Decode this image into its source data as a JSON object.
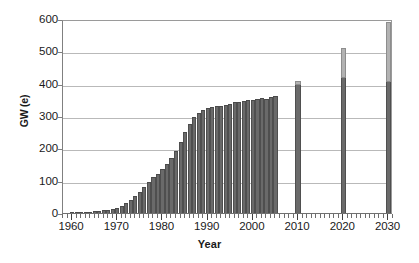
{
  "chart_data": {
    "type": "bar",
    "title": "",
    "xlabel": "Year",
    "ylabel": "GW (e)",
    "xlim": [
      1958,
      2031
    ],
    "ylim": [
      0,
      600
    ],
    "grid": true,
    "legend": "none",
    "y_ticks": [
      0,
      100,
      200,
      300,
      400,
      500,
      600
    ],
    "x_ticks": [
      1960,
      1970,
      1980,
      1990,
      2000,
      2010,
      2020,
      2030
    ],
    "x_tick_labels": [
      "1960",
      "1970",
      "1980",
      "1990",
      "2000",
      "2010",
      "2020",
      "2030"
    ],
    "y_tick_labels": [
      "0",
      "100",
      "200",
      "300",
      "400",
      "500",
      "600"
    ],
    "series": [
      {
        "name": "Installed nuclear capacity (historical)",
        "color": "#6a6a6a",
        "x": [
          1960,
          1961,
          1962,
          1963,
          1964,
          1965,
          1966,
          1967,
          1968,
          1969,
          1970,
          1971,
          1972,
          1973,
          1974,
          1975,
          1976,
          1977,
          1978,
          1979,
          1980,
          1981,
          1982,
          1983,
          1984,
          1985,
          1986,
          1987,
          1988,
          1989,
          1990,
          1991,
          1992,
          1993,
          1994,
          1995,
          1996,
          1997,
          1998,
          1999,
          2000,
          2001,
          2002,
          2003,
          2004,
          2005
        ],
        "values": [
          1,
          1,
          2,
          2,
          3,
          5,
          7,
          9,
          10,
          12,
          16,
          22,
          30,
          40,
          52,
          66,
          80,
          95,
          110,
          122,
          135,
          152,
          170,
          192,
          220,
          250,
          276,
          296,
          310,
          318,
          325,
          328,
          330,
          331,
          334,
          336,
          344,
          344,
          345,
          350,
          351,
          352,
          356,
          352,
          358,
          362
        ]
      },
      {
        "name": "Projected capacity (lower estimate)",
        "color": "#6a6a6a",
        "x": [
          2010,
          2020,
          2030
        ],
        "values": [
          395,
          418,
          405
        ]
      },
      {
        "name": "Projected capacity (upper estimate)",
        "color": "#b2b2b2",
        "x": [
          2010,
          2020,
          2030
        ],
        "values": [
          408,
          510,
          590
        ]
      }
    ]
  }
}
